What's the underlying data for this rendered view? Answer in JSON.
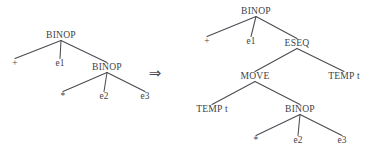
{
  "figure": {
    "background_color": "#ffffff",
    "ink_color": "#3f3f47",
    "edge_color": "#4a4a52",
    "width": 372,
    "height": 157
  },
  "rewrite_arrow": {
    "glyph": "⇒",
    "name": "double-right-arrow",
    "x": 155,
    "y": 78
  },
  "left_tree": {
    "name": "source-expression-tree",
    "nodes": [
      {
        "id": "L0",
        "label": "BINOP",
        "x": 61,
        "y": 38,
        "kind": "op"
      },
      {
        "id": "L1",
        "label": "+",
        "x": 15,
        "y": 66,
        "kind": "leaf"
      },
      {
        "id": "L2",
        "label": "e1",
        "x": 60,
        "y": 66,
        "kind": "leaf"
      },
      {
        "id": "L3",
        "label": "BINOP",
        "x": 107,
        "y": 70,
        "kind": "op"
      },
      {
        "id": "L4",
        "label": "*",
        "x": 63,
        "y": 99,
        "kind": "leaf"
      },
      {
        "id": "L5",
        "label": "e2",
        "x": 104,
        "y": 99,
        "kind": "leaf"
      },
      {
        "id": "L6",
        "label": "e3",
        "x": 145,
        "y": 99,
        "kind": "leaf"
      }
    ],
    "edges": [
      {
        "from": "L0",
        "to": "L1"
      },
      {
        "from": "L0",
        "to": "L2"
      },
      {
        "from": "L0",
        "to": "L3"
      },
      {
        "from": "L3",
        "to": "L4"
      },
      {
        "from": "L3",
        "to": "L5"
      },
      {
        "from": "L3",
        "to": "L6"
      }
    ]
  },
  "right_tree": {
    "name": "rewritten-expression-tree",
    "nodes": [
      {
        "id": "R0",
        "label": "BINOP",
        "x": 256,
        "y": 14,
        "kind": "op"
      },
      {
        "id": "R1",
        "label": "+",
        "x": 207,
        "y": 44,
        "kind": "leaf"
      },
      {
        "id": "R2",
        "label": "e1",
        "x": 251,
        "y": 44,
        "kind": "leaf"
      },
      {
        "id": "R3",
        "label": "ESEQ",
        "x": 297,
        "y": 46,
        "kind": "op"
      },
      {
        "id": "R4",
        "label": "MOVE",
        "x": 255,
        "y": 79,
        "kind": "op"
      },
      {
        "id": "R5",
        "label": "TEMP t",
        "x": 344,
        "y": 79,
        "kind": "op"
      },
      {
        "id": "R6",
        "label": "TEMP t",
        "x": 212,
        "y": 112,
        "kind": "op"
      },
      {
        "id": "R7",
        "label": "BINOP",
        "x": 300,
        "y": 112,
        "kind": "op"
      },
      {
        "id": "R8",
        "label": "*",
        "x": 256,
        "y": 143,
        "kind": "leaf"
      },
      {
        "id": "R9",
        "label": "e2",
        "x": 298,
        "y": 143,
        "kind": "leaf"
      },
      {
        "id": "R10",
        "label": "e3",
        "x": 342,
        "y": 143,
        "kind": "leaf"
      }
    ],
    "edges": [
      {
        "from": "R0",
        "to": "R1"
      },
      {
        "from": "R0",
        "to": "R2"
      },
      {
        "from": "R0",
        "to": "R3"
      },
      {
        "from": "R3",
        "to": "R4"
      },
      {
        "from": "R3",
        "to": "R5"
      },
      {
        "from": "R4",
        "to": "R6"
      },
      {
        "from": "R4",
        "to": "R7"
      },
      {
        "from": "R7",
        "to": "R8"
      },
      {
        "from": "R7",
        "to": "R9"
      },
      {
        "from": "R7",
        "to": "R10"
      }
    ]
  }
}
